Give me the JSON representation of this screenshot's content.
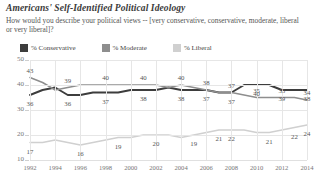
{
  "header": {
    "title": "Americans' Self-Identified Political Ideology",
    "subtitle": "How would you describe your political views -- [very conservative, conservative, moderate, liberal or very liberal]?"
  },
  "legend": {
    "position": "top-left",
    "items": [
      {
        "label": "% Conservative",
        "color": "#3d3d3d"
      },
      {
        "label": "% Moderate",
        "color": "#8e8e8e"
      },
      {
        "label": "% Liberal",
        "color": "#d0d0d0"
      }
    ]
  },
  "chart_data": {
    "type": "line",
    "title": "Americans' Self-Identified Political Ideology",
    "subtitle": "How would you describe your political views -- [very conservative, conservative, moderate, liberal or very liberal]?",
    "xlabel": "",
    "ylabel": "",
    "ylim": [
      10,
      50
    ],
    "yticks": [
      10,
      20,
      30,
      40,
      50
    ],
    "grid": true,
    "x": [
      1992,
      1993,
      1994,
      1995,
      1996,
      1997,
      1998,
      1999,
      2000,
      2001,
      2002,
      2003,
      2004,
      2005,
      2006,
      2007,
      2008,
      2009,
      2010,
      2011,
      2012,
      2013,
      2014
    ],
    "xticklabels": [
      "1992",
      "1994",
      "1996",
      "1998",
      "2000",
      "2002",
      "2004",
      "2006",
      "2008",
      "2010",
      "2012",
      "2014"
    ],
    "series": [
      {
        "name": "% Conservative",
        "color": "#3d3d3d",
        "values": [
          36,
          38,
          39,
          36,
          36,
          37,
          37,
          37,
          38,
          38,
          38,
          39,
          38,
          38,
          38,
          37,
          37,
          40,
          40,
          40,
          38,
          38,
          38
        ],
        "labels": [
          {
            "x": 1992,
            "value": 36
          },
          {
            "x": 1995,
            "value": 36
          },
          {
            "x": 1998,
            "value": 37
          },
          {
            "x": 2001,
            "value": 38
          },
          {
            "x": 2004,
            "value": 38
          },
          {
            "x": 2006,
            "value": 37
          },
          {
            "x": 2008,
            "value": 37
          },
          {
            "x": 2010,
            "value": 40
          },
          {
            "x": 2012,
            "value": 39
          },
          {
            "x": 2014,
            "value": 38
          }
        ]
      },
      {
        "name": "% Moderate",
        "color": "#8e8e8e",
        "values": [
          43,
          41,
          38,
          39,
          40,
          40,
          40,
          40,
          40,
          40,
          40,
          39,
          40,
          39,
          38,
          37,
          37,
          36,
          35,
          35,
          35,
          35,
          34
        ],
        "labels": [
          {
            "x": 1992,
            "value": 43
          },
          {
            "x": 1995,
            "value": 39
          },
          {
            "x": 1998,
            "value": 40
          },
          {
            "x": 2001,
            "value": 40
          },
          {
            "x": 2004,
            "value": 40
          },
          {
            "x": 2006,
            "value": 38
          },
          {
            "x": 2008,
            "value": 37
          },
          {
            "x": 2010,
            "value": 35
          },
          {
            "x": 2012,
            "value": 35
          },
          {
            "x": 2014,
            "value": 34
          }
        ]
      },
      {
        "name": "% Liberal",
        "color": "#d0d0d0",
        "values": [
          17,
          17,
          18,
          17,
          16,
          17,
          18,
          19,
          19,
          20,
          20,
          20,
          19,
          20,
          21,
          22,
          22,
          22,
          21,
          21,
          22,
          23,
          24
        ],
        "labels": [
          {
            "x": 1992,
            "value": 17
          },
          {
            "x": 1996,
            "value": 16
          },
          {
            "x": 1999,
            "value": 19
          },
          {
            "x": 2002,
            "value": 20
          },
          {
            "x": 2005,
            "value": 19
          },
          {
            "x": 2007,
            "value": 21
          },
          {
            "x": 2008,
            "value": 22
          },
          {
            "x": 2011,
            "value": 21
          },
          {
            "x": 2013,
            "value": 22
          },
          {
            "x": 2014,
            "value": 24
          }
        ]
      }
    ]
  }
}
